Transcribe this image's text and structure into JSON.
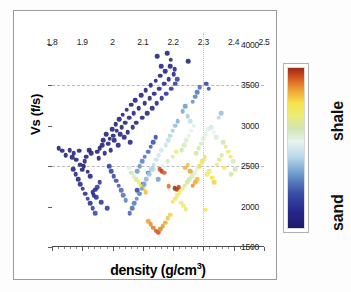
{
  "figure": {
    "background": "#ffffff",
    "frame_color": "#9a9a9a"
  },
  "legend": {
    "high_label": "shale",
    "low_label": "sand",
    "colormap_name": "jet-sand-shale",
    "stops": [
      {
        "pos": 0,
        "color": "#1b1b6b"
      },
      {
        "pos": 0.1,
        "color": "#26268a"
      },
      {
        "pos": 0.22,
        "color": "#3a4fa8"
      },
      {
        "pos": 0.34,
        "color": "#6f9ccd"
      },
      {
        "pos": 0.45,
        "color": "#bcdcea"
      },
      {
        "pos": 0.54,
        "color": "#e8f3ee"
      },
      {
        "pos": 0.62,
        "color": "#cfe6b4"
      },
      {
        "pos": 0.7,
        "color": "#ecec7a"
      },
      {
        "pos": 0.78,
        "color": "#f6e34a"
      },
      {
        "pos": 0.86,
        "color": "#efa335"
      },
      {
        "pos": 0.94,
        "color": "#d5541f"
      },
      {
        "pos": 1.0,
        "color": "#9c2a16"
      }
    ]
  },
  "chart_data": {
    "type": "scatter",
    "title": "",
    "xlabel_text": "density (g/cm",
    "xlabel_sup": "3",
    "xlabel_tail": ")",
    "ylabel": "Vs (f/s)",
    "xlim": [
      1.8,
      2.5
    ],
    "ylim": [
      1500,
      4150
    ],
    "xticks": [
      1.8,
      1.9,
      2.0,
      2.1,
      2.2,
      2.3,
      2.4,
      2.5
    ],
    "xticklabels": [
      "1.8",
      "1.9",
      "2",
      "2.1",
      "2.2",
      "2.3",
      "2.4",
      "2.5"
    ],
    "yticks": [
      1500,
      2000,
      2500,
      3000,
      3500,
      4000
    ],
    "yticklabels": [
      "1500",
      "2000",
      "2500",
      "3000",
      "3500",
      "4000"
    ],
    "grid": {
      "horizontal_lines": [
        2500,
        3500
      ],
      "vertical_lines": [
        2.3
      ],
      "style": "dashed"
    },
    "colorbar_variable": "lithology (sand to shale)",
    "colorbar_range": [
      0,
      1
    ],
    "points": [
      [
        1.822,
        2720,
        0.04
      ],
      [
        1.833,
        2690,
        0.05
      ],
      [
        1.845,
        2640,
        0.03
      ],
      [
        1.858,
        2700,
        0.05
      ],
      [
        1.866,
        2615,
        0.04
      ],
      [
        1.872,
        2660,
        0.06
      ],
      [
        1.88,
        2580,
        0.03
      ],
      [
        1.889,
        2690,
        0.05
      ],
      [
        1.893,
        2520,
        0.04
      ],
      [
        1.9,
        2455,
        0.05
      ],
      [
        1.905,
        2500,
        0.03
      ],
      [
        1.908,
        2560,
        0.06
      ],
      [
        1.912,
        2620,
        0.04
      ],
      [
        1.918,
        2430,
        0.05
      ],
      [
        1.922,
        2700,
        0.03
      ],
      [
        1.926,
        2380,
        0.07
      ],
      [
        1.93,
        2660,
        0.05
      ],
      [
        1.934,
        2180,
        0.1
      ],
      [
        1.938,
        2140,
        0.12
      ],
      [
        1.942,
        2210,
        0.09
      ],
      [
        1.946,
        2120,
        0.13
      ],
      [
        1.95,
        2680,
        0.04
      ],
      [
        1.954,
        2600,
        0.05
      ],
      [
        1.958,
        2720,
        0.03
      ],
      [
        1.962,
        2055,
        0.14
      ],
      [
        1.966,
        2760,
        0.05
      ],
      [
        1.97,
        2820,
        0.04
      ],
      [
        1.974,
        2660,
        0.06
      ],
      [
        1.978,
        2900,
        0.04
      ],
      [
        1.982,
        1980,
        0.16
      ],
      [
        1.986,
        2780,
        0.05
      ],
      [
        1.99,
        2840,
        0.04
      ],
      [
        1.994,
        2700,
        0.06
      ],
      [
        1.998,
        2960,
        0.05
      ],
      [
        2.002,
        2880,
        0.04
      ],
      [
        2.006,
        2820,
        0.06
      ],
      [
        2.01,
        3020,
        0.04
      ],
      [
        2.014,
        2940,
        0.05
      ],
      [
        2.018,
        2760,
        0.07
      ],
      [
        2.022,
        3080,
        0.04
      ],
      [
        2.026,
        2900,
        0.06
      ],
      [
        2.03,
        2980,
        0.05
      ],
      [
        2.034,
        3140,
        0.04
      ],
      [
        2.038,
        2860,
        0.07
      ],
      [
        2.042,
        3040,
        0.05
      ],
      [
        2.046,
        3200,
        0.04
      ],
      [
        2.05,
        2920,
        0.06
      ],
      [
        2.054,
        3100,
        0.05
      ],
      [
        2.058,
        2800,
        0.08
      ],
      [
        2.062,
        3260,
        0.04
      ],
      [
        2.066,
        2980,
        0.06
      ],
      [
        2.07,
        3160,
        0.05
      ],
      [
        2.074,
        3320,
        0.04
      ],
      [
        2.078,
        3040,
        0.07
      ],
      [
        2.082,
        2200,
        0.2
      ],
      [
        2.086,
        3220,
        0.05
      ],
      [
        2.09,
        2160,
        0.22
      ],
      [
        2.094,
        3380,
        0.04
      ],
      [
        2.098,
        3100,
        0.06
      ],
      [
        2.102,
        2280,
        0.18
      ],
      [
        2.106,
        3280,
        0.05
      ],
      [
        2.11,
        3440,
        0.04
      ],
      [
        2.114,
        3160,
        0.07
      ],
      [
        2.118,
        2420,
        0.3
      ],
      [
        2.122,
        3340,
        0.05
      ],
      [
        2.126,
        3500,
        0.04
      ],
      [
        2.13,
        3220,
        0.08
      ],
      [
        2.134,
        2460,
        0.45
      ],
      [
        2.138,
        3400,
        0.05
      ],
      [
        2.142,
        3560,
        0.04
      ],
      [
        2.146,
        3280,
        0.09
      ],
      [
        2.15,
        2340,
        0.35
      ],
      [
        2.154,
        3460,
        0.06
      ],
      [
        2.158,
        3620,
        0.04
      ],
      [
        2.162,
        3340,
        0.1
      ],
      [
        2.166,
        2500,
        0.55
      ],
      [
        2.17,
        3520,
        0.07
      ],
      [
        2.174,
        3680,
        0.05
      ],
      [
        2.178,
        3400,
        0.12
      ],
      [
        2.182,
        2560,
        0.6
      ],
      [
        2.186,
        3580,
        0.08
      ],
      [
        2.19,
        3740,
        0.05
      ],
      [
        2.194,
        3460,
        0.14
      ],
      [
        2.198,
        2620,
        0.65
      ],
      [
        2.202,
        3640,
        0.1
      ],
      [
        2.206,
        3520,
        0.16
      ],
      [
        2.21,
        2680,
        0.7
      ],
      [
        2.214,
        3580,
        0.18
      ],
      [
        2.055,
        2480,
        0.52
      ],
      [
        2.062,
        2420,
        0.62
      ],
      [
        2.07,
        2380,
        0.58
      ],
      [
        2.078,
        2340,
        0.66
      ],
      [
        2.086,
        2300,
        0.72
      ],
      [
        2.094,
        2260,
        0.78
      ],
      [
        2.102,
        2220,
        0.8
      ],
      [
        2.11,
        2180,
        0.83
      ],
      [
        2.118,
        1820,
        0.86
      ],
      [
        2.126,
        1780,
        0.88
      ],
      [
        2.134,
        1740,
        0.9
      ],
      [
        2.142,
        1700,
        0.92
      ],
      [
        2.15,
        1680,
        0.94
      ],
      [
        2.158,
        1720,
        0.89
      ],
      [
        2.166,
        1760,
        0.87
      ],
      [
        2.174,
        1800,
        0.85
      ],
      [
        2.182,
        1860,
        0.82
      ],
      [
        2.19,
        1900,
        0.8
      ],
      [
        2.198,
        2060,
        0.76
      ],
      [
        2.206,
        2100,
        0.74
      ],
      [
        2.214,
        2140,
        0.72
      ],
      [
        2.222,
        2180,
        0.7
      ],
      [
        2.23,
        2220,
        0.68
      ],
      [
        2.238,
        2260,
        0.66
      ],
      [
        2.246,
        2300,
        0.64
      ],
      [
        2.254,
        2340,
        0.62
      ],
      [
        2.262,
        2380,
        0.6
      ],
      [
        2.27,
        2420,
        0.58
      ],
      [
        2.278,
        2460,
        0.56
      ],
      [
        2.286,
        2500,
        0.54
      ],
      [
        2.294,
        2540,
        0.52
      ],
      [
        2.302,
        2580,
        0.5
      ],
      [
        2.155,
        2460,
        0.95
      ],
      [
        2.162,
        2440,
        0.97
      ],
      [
        2.17,
        2420,
        0.93
      ],
      [
        2.205,
        2230,
        0.99
      ],
      [
        2.212,
        2215,
        0.98
      ],
      [
        2.218,
        2240,
        0.96
      ],
      [
        2.186,
        2250,
        0.91
      ],
      [
        2.24,
        2480,
        0.84
      ],
      [
        2.248,
        2520,
        0.82
      ],
      [
        2.256,
        2440,
        0.86
      ],
      [
        2.264,
        2260,
        0.88
      ],
      [
        2.272,
        2300,
        0.85
      ],
      [
        2.28,
        2340,
        0.83
      ],
      [
        2.288,
        2500,
        0.79
      ],
      [
        2.296,
        2560,
        0.77
      ],
      [
        2.304,
        2620,
        0.75
      ],
      [
        2.312,
        2400,
        0.73
      ],
      [
        2.32,
        2440,
        0.71
      ],
      [
        2.328,
        2360,
        0.78
      ],
      [
        2.336,
        2300,
        0.8
      ],
      [
        2.344,
        2520,
        0.69
      ],
      [
        2.352,
        2580,
        0.67
      ],
      [
        2.36,
        2640,
        0.65
      ],
      [
        2.368,
        2480,
        0.72
      ],
      [
        2.228,
        2700,
        0.62
      ],
      [
        2.236,
        2760,
        0.6
      ],
      [
        2.244,
        2820,
        0.58
      ],
      [
        2.252,
        2880,
        0.56
      ],
      [
        2.26,
        2940,
        0.54
      ],
      [
        2.268,
        3000,
        0.52
      ],
      [
        2.276,
        2660,
        0.64
      ],
      [
        2.284,
        2720,
        0.61
      ],
      [
        2.292,
        2780,
        0.59
      ],
      [
        2.3,
        2840,
        0.57
      ],
      [
        2.308,
        2900,
        0.55
      ],
      [
        2.316,
        2960,
        0.53
      ],
      [
        2.175,
        2760,
        0.48
      ],
      [
        2.183,
        2820,
        0.46
      ],
      [
        2.191,
        2880,
        0.44
      ],
      [
        2.199,
        2940,
        0.42
      ],
      [
        2.207,
        3000,
        0.4
      ],
      [
        2.215,
        3060,
        0.38
      ],
      [
        2.16,
        2700,
        0.5
      ],
      [
        2.152,
        2640,
        0.49
      ],
      [
        2.144,
        2580,
        0.47
      ],
      [
        2.136,
        2520,
        0.45
      ],
      [
        2.128,
        2460,
        0.43
      ],
      [
        2.12,
        2400,
        0.41
      ],
      [
        2.112,
        2340,
        0.39
      ],
      [
        2.104,
        2280,
        0.37
      ],
      [
        2.096,
        2220,
        0.35
      ],
      [
        2.088,
        2160,
        0.33
      ],
      [
        2.08,
        2100,
        0.31
      ],
      [
        2.072,
        2040,
        0.29
      ],
      [
        2.064,
        1980,
        0.27
      ],
      [
        2.056,
        1920,
        0.25
      ],
      [
        2.232,
        3180,
        0.36
      ],
      [
        2.24,
        3240,
        0.34
      ],
      [
        2.248,
        3120,
        0.42
      ],
      [
        2.256,
        3060,
        0.46
      ],
      [
        2.264,
        3300,
        0.32
      ],
      [
        2.272,
        3360,
        0.3
      ],
      [
        2.28,
        3420,
        0.28
      ],
      [
        2.288,
        3480,
        0.26
      ],
      [
        2.16,
        3740,
        0.06
      ],
      [
        2.192,
        3820,
        0.05
      ],
      [
        2.25,
        3800,
        0.06
      ],
      [
        2.205,
        3700,
        0.08
      ],
      [
        2.31,
        3520,
        0.18
      ],
      [
        2.318,
        3460,
        0.22
      ],
      [
        2.326,
        2980,
        0.5
      ],
      [
        2.334,
        2920,
        0.54
      ],
      [
        2.342,
        2860,
        0.58
      ],
      [
        2.35,
        3100,
        0.44
      ],
      [
        2.358,
        3160,
        0.4
      ],
      [
        2.366,
        2800,
        0.62
      ],
      [
        2.374,
        2740,
        0.66
      ],
      [
        2.382,
        2680,
        0.7
      ],
      [
        2.39,
        2620,
        0.74
      ],
      [
        2.398,
        2560,
        0.6
      ],
      [
        1.87,
        2460,
        0.06
      ],
      [
        1.878,
        2400,
        0.08
      ],
      [
        1.886,
        2340,
        0.07
      ],
      [
        1.894,
        2280,
        0.09
      ],
      [
        1.902,
        2220,
        0.11
      ],
      [
        1.91,
        2160,
        0.13
      ],
      [
        1.918,
        2100,
        0.15
      ],
      [
        1.926,
        2040,
        0.12
      ],
      [
        1.934,
        1980,
        0.18
      ],
      [
        1.942,
        1920,
        0.2
      ],
      [
        1.95,
        2240,
        0.16
      ],
      [
        1.958,
        2300,
        0.14
      ],
      [
        2.02,
        2260,
        0.24
      ],
      [
        2.028,
        2200,
        0.26
      ],
      [
        2.036,
        2140,
        0.28
      ],
      [
        2.044,
        2080,
        0.3
      ],
      [
        2.012,
        2320,
        0.22
      ],
      [
        2.004,
        2380,
        0.2
      ],
      [
        1.996,
        2440,
        0.18
      ],
      [
        1.988,
        2500,
        0.17
      ],
      [
        2.118,
        2680,
        0.26
      ],
      [
        2.126,
        2740,
        0.24
      ],
      [
        2.134,
        2800,
        0.22
      ],
      [
        2.142,
        2860,
        0.2
      ],
      [
        2.098,
        2560,
        0.3
      ],
      [
        2.106,
        2620,
        0.28
      ],
      [
        2.09,
        2500,
        0.32
      ],
      [
        2.082,
        2440,
        0.34
      ],
      [
        2.226,
        2050,
        0.68
      ],
      [
        2.234,
        2010,
        0.71
      ],
      [
        2.242,
        1970,
        0.73
      ],
      [
        2.306,
        1960,
        0.76
      ],
      [
        2.18,
        3900,
        0.04
      ],
      [
        2.148,
        3860,
        0.05
      ],
      [
        2.392,
        2400,
        0.64
      ],
      [
        2.404,
        2460,
        0.62
      ]
    ]
  }
}
